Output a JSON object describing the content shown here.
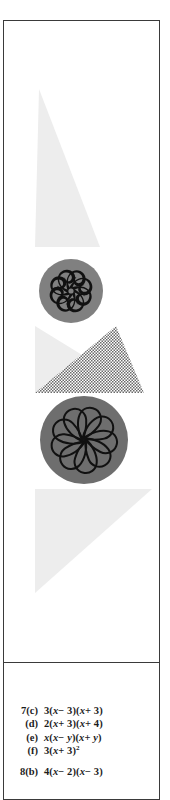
{
  "page": {
    "kind": "scanned-textbook-page-strip",
    "background_color": "#ffffff",
    "frame_border_color": "#3a3a3a"
  },
  "figure_panel": {
    "name": "decorative-ornament-figure",
    "background_color": "#ffffff",
    "shapes": [
      {
        "id": "upper-wedge",
        "kind": "triangle",
        "fill": "#ededed",
        "points": "35,68 31,226 96,226"
      },
      {
        "id": "mid-light-triangle",
        "kind": "triangle",
        "fill": "#ededed",
        "points": "31,305 31,372 140,372"
      },
      {
        "id": "halftone-triangle",
        "kind": "triangle",
        "fill": "halftone-checker",
        "points": "112,305 31,372 140,372"
      },
      {
        "id": "lower-triangle",
        "kind": "triangle",
        "fill": "#ededed",
        "points": "31,468 148,468 31,572"
      }
    ],
    "ornaments": [
      {
        "id": "spiral-rosette",
        "label": "spiral-rosette-medallion",
        "disc_color": "#808080",
        "motif_color": "#111111",
        "center_x": 67,
        "center_y": 270,
        "radius": 32,
        "petal_count": 8,
        "motif": "curled-scroll-pinwheel"
      },
      {
        "id": "petal-rosette",
        "label": "petal-rosette-medallion",
        "disc_color": "#6e6e6e",
        "motif_color": "#111111",
        "center_x": 80,
        "center_y": 419,
        "radius": 44,
        "petal_count": 9,
        "motif": "teardrop-petal-flower-outline"
      }
    ]
  },
  "answers": {
    "groups": [
      {
        "id": "group-7",
        "lines": [
          {
            "label": "7(c)",
            "expr_html": "3(<i>x</i>− 3)(<i>x</i>+ 3)"
          },
          {
            "label": "(d)",
            "expr_html": "2(<i>x</i>+ 3)(<i>x</i>+ 4)"
          },
          {
            "label": "(e)",
            "expr_html": "<i>x</i>(<i>x</i>− <i>y</i>)(<i>x</i>+ <i>y</i>)"
          },
          {
            "label": "(f)",
            "expr_html": "3(<i>x</i>+ 3)<sup>2</sup>"
          }
        ]
      },
      {
        "id": "group-8",
        "lines": [
          {
            "label": "8(b)",
            "expr_html": "4(<i>x</i>− 2)(<i>x</i>− 3)"
          }
        ]
      }
    ]
  }
}
